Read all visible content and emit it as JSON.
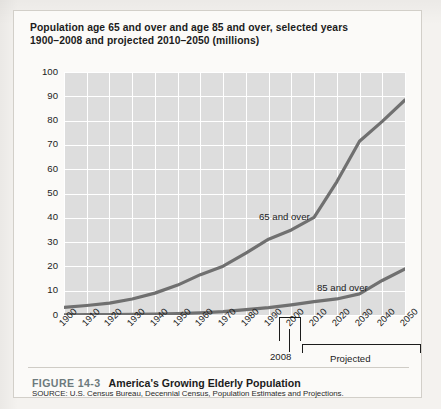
{
  "figure": {
    "title_line1": "Population age 65 and over and age 85 and over, selected years",
    "title_line2": "1900–2008 and projected 2010–2050 (millions)",
    "figure_number": "FIGURE 14-3",
    "caption": "America's Growing Elderly Population",
    "source": "SOURCE: U.S. Census Bureau, Decennial Census, Population Estimates and Projections."
  },
  "annotations": {
    "year_marker": "2008",
    "projected_bracket": "Projected"
  },
  "colors": {
    "plot_background": "#dddddd",
    "gridline": "#ffffff",
    "line": "#707070",
    "text": "#1c1c1c",
    "figure_number": "#6d7a7d",
    "card_background": "#fbfaf8"
  },
  "chart_data": {
    "type": "line",
    "title": "Population age 65 and over and age 85 and over, selected years 1900–2008 and projected 2010–2050 (millions)",
    "xlabel": "",
    "ylabel": "",
    "ylim": [
      0,
      100
    ],
    "yticks": [
      0,
      10,
      20,
      30,
      40,
      50,
      60,
      70,
      80,
      90,
      100
    ],
    "grid": true,
    "legend": "inline-labels",
    "categories": [
      "1900",
      "1910",
      "1920",
      "1930",
      "1940",
      "1950",
      "1960",
      "1970",
      "1980",
      "1990",
      "2000",
      "2010",
      "2020",
      "2030",
      "2040",
      "2050"
    ],
    "series": [
      {
        "name": "65 and over",
        "values": [
          3.1,
          3.9,
          4.9,
          6.6,
          9.0,
          12.3,
          16.6,
          20.1,
          25.5,
          31.2,
          35.0,
          40.2,
          54.8,
          71.5,
          79.7,
          88.5
        ]
      },
      {
        "name": "85 and over",
        "values": [
          0.1,
          0.2,
          0.2,
          0.3,
          0.4,
          0.6,
          0.9,
          1.4,
          2.2,
          3.0,
          4.2,
          5.5,
          6.6,
          8.7,
          14.2,
          19.0
        ]
      }
    ],
    "projection_starts_at": "2010",
    "last_actual_year": "2008"
  }
}
